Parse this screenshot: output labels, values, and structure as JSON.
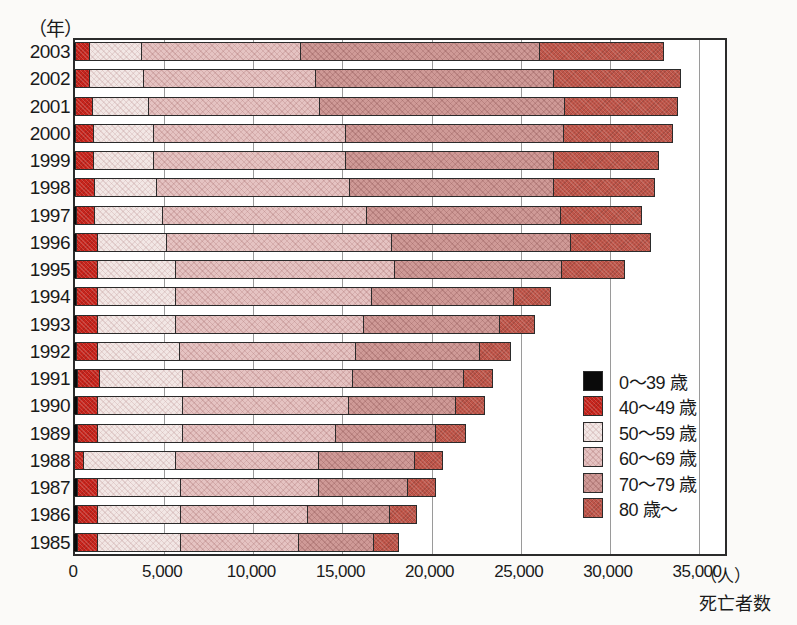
{
  "axis": {
    "year_unit": "（年）",
    "x_unit": "（人）",
    "x_title": "死亡者数",
    "x_ticks": [
      "0",
      "5,000",
      "10,000",
      "15,000",
      "20,000",
      "25,000",
      "30,000",
      "35,000"
    ]
  },
  "legend": {
    "items": [
      {
        "label": "0〜39 歳",
        "color": "#0a0a0a",
        "class": "g0"
      },
      {
        "label": "40〜49 歳",
        "color": "#c8241c",
        "class": "g1"
      },
      {
        "label": "50〜59 歳",
        "color": "#f2e7e5",
        "class": "g2"
      },
      {
        "label": "60〜69 歳",
        "color": "#e5c3c2",
        "class": "g3"
      },
      {
        "label": "70〜79 歳",
        "color": "#cf9a97",
        "class": "g4"
      },
      {
        "label": "80 歳〜",
        "color": "#bf5549",
        "class": "g5"
      }
    ]
  },
  "chart_data": {
    "type": "bar",
    "orientation": "horizontal",
    "stacked": true,
    "title": "",
    "xlabel": "死亡者数",
    "ylabel": "（年）",
    "xlim": [
      0,
      35000
    ],
    "xtick_step": 5000,
    "grid": true,
    "legend_position": "inside-right",
    "categories": [
      "2003",
      "2002",
      "2001",
      "2000",
      "1999",
      "1998",
      "1997",
      "1996",
      "1995",
      "1994",
      "1993",
      "1992",
      "1991",
      "1990",
      "1989",
      "1988",
      "1987",
      "1986",
      "1985"
    ],
    "series": [
      {
        "name": "0〜39 歳",
        "values": [
          150,
          150,
          170,
          170,
          170,
          190,
          200,
          210,
          220,
          230,
          240,
          250,
          260,
          260,
          260,
          140,
          270,
          280,
          280
        ]
      },
      {
        "name": "40〜49 歳",
        "values": [
          850,
          900,
          1030,
          1080,
          1080,
          1110,
          1100,
          1290,
          1280,
          1270,
          1260,
          1250,
          1340,
          1240,
          1240,
          560,
          1230,
          1220,
          1220
        ]
      },
      {
        "name": "50〜59 歳",
        "values": [
          3000,
          3100,
          3200,
          3450,
          3450,
          3550,
          3900,
          3900,
          4400,
          4400,
          4400,
          4650,
          4700,
          4800,
          4800,
          5200,
          4700,
          4700,
          4700
        ]
      },
      {
        "name": "60〜69 歳",
        "values": [
          9000,
          9700,
          9700,
          10850,
          10850,
          10900,
          11500,
          12700,
          12400,
          11100,
          10650,
          9950,
          9600,
          9400,
          8700,
          8100,
          7800,
          7200,
          6700
        ]
      },
      {
        "name": "70〜79 歳",
        "values": [
          13500,
          13450,
          13800,
          12300,
          11700,
          11550,
          10950,
          10100,
          9400,
          8050,
          7700,
          7000,
          6350,
          6100,
          5650,
          5450,
          5100,
          4650,
          4250
        ]
      },
      {
        "name": "80 歳〜",
        "values": [
          7000,
          7150,
          6400,
          6150,
          6000,
          5700,
          4650,
          4600,
          3600,
          2150,
          2050,
          1850,
          1650,
          1700,
          1750,
          1650,
          1650,
          1600,
          1500
        ]
      }
    ],
    "totals": [
      33500,
      34450,
      34300,
      34000,
      33250,
      33000,
      32300,
      32800,
      31300,
      27200,
      26300,
      24950,
      23900,
      23500,
      22400,
      21100,
      20750,
      19650,
      18650
    ]
  }
}
